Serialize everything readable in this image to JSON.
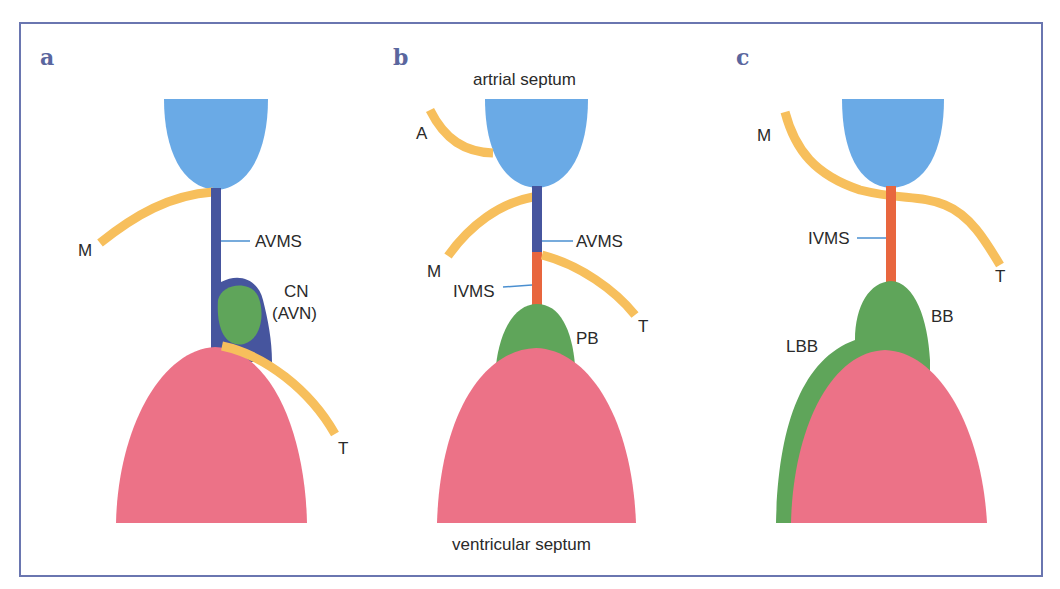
{
  "figure": {
    "colors": {
      "atrial": "#6aaae6",
      "avms": "#46559e",
      "ivms": "#e8663e",
      "node": "#5fa55a",
      "ventricle": "#ec7287",
      "valve": "#f7bf5c",
      "leader": "#4a8fd0",
      "frame": "#6a76b0",
      "panel_letter": "#5a669e"
    },
    "panels": [
      {
        "letter": "a",
        "labels": {
          "M": "M",
          "AVMS": "AVMS",
          "CN": "CN",
          "AVN": "(AVN)",
          "T": "T"
        }
      },
      {
        "letter": "b",
        "labels": {
          "top": "artrial septum",
          "A": "A",
          "M": "M",
          "AVMS": "AVMS",
          "IVMS": "IVMS",
          "PB": "PB",
          "T": "T",
          "bottom": "ventricular septum"
        }
      },
      {
        "letter": "c",
        "labels": {
          "M": "M",
          "IVMS": "IVMS",
          "T": "T",
          "BB": "BB",
          "LBB": "LBB"
        }
      }
    ]
  }
}
